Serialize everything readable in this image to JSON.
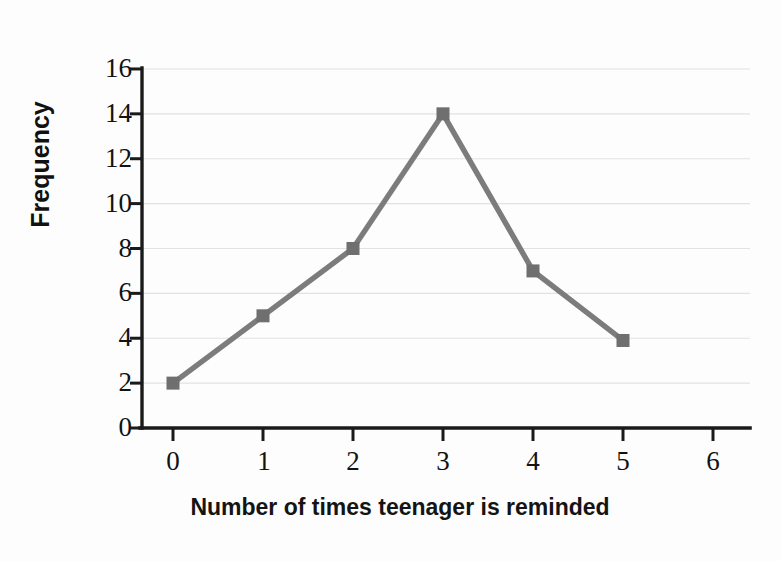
{
  "chart_data": {
    "type": "line",
    "title": "",
    "xlabel": "Number of times teenager is reminded",
    "ylabel": "Frequency",
    "x": [
      0,
      1,
      2,
      3,
      4,
      5
    ],
    "values": [
      2,
      5,
      8,
      14,
      7,
      3.9
    ],
    "series": [
      {
        "name": "Frequency",
        "values": [
          2,
          5,
          8,
          14,
          7,
          3.9
        ]
      }
    ],
    "xlim": [
      0,
      6
    ],
    "ylim": [
      0,
      16
    ],
    "x_ticks": [
      "0",
      "1",
      "2",
      "3",
      "4",
      "5",
      "6"
    ],
    "y_ticks": [
      "0",
      "2",
      "4",
      "6",
      "8",
      "10",
      "12",
      "14",
      "16"
    ],
    "grid": "horizontal",
    "legend": "none",
    "marker": "square",
    "line_color": "#7c7c7c",
    "marker_color": "#6f6f6f",
    "grid_color": "#e2e2e2",
    "axis_color": "#1a1a1a"
  },
  "axes": {
    "y_label": "Frequency",
    "x_label": "Number of times teenager is reminded"
  }
}
